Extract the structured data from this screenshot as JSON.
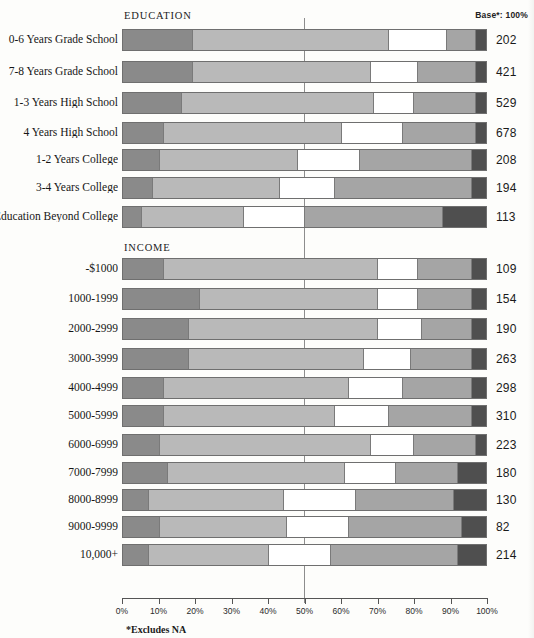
{
  "headers": {
    "education": "EDUCATION",
    "income": "INCOME",
    "base": "Base*: 100%"
  },
  "footnote": "*Excludes NA",
  "axis": {
    "ticks": [
      "0%",
      "10%",
      "20%",
      "30%",
      "40%",
      "50%",
      "60%",
      "70%",
      "80%",
      "90%",
      "100%"
    ],
    "values": [
      0,
      10,
      20,
      30,
      40,
      50,
      60,
      70,
      80,
      90,
      100
    ],
    "reference_line": 50
  },
  "colors": {
    "seg1": "#8a8a8a",
    "seg2": "#b9b9b9",
    "seg3": "#ffffff",
    "seg4": "#a5a5a5",
    "seg5": "#4f4f4f",
    "outline": "#6f6f6f",
    "rule": "#8d8d8d"
  },
  "chart_data": {
    "type": "bar",
    "title": "",
    "subtitle": "",
    "orientation": "horizontal",
    "stacked": true,
    "normalized": true,
    "xlabel": "",
    "ylabel": "",
    "xlim": [
      0,
      100
    ],
    "grid": false,
    "legend_position": "none",
    "reference_line": 50,
    "base_column_header": "Base*: 100%",
    "series": [
      {
        "name": "segment-1",
        "color": "#8a8a8a"
      },
      {
        "name": "segment-2",
        "color": "#b9b9b9"
      },
      {
        "name": "segment-3",
        "color": "#ffffff"
      },
      {
        "name": "segment-4",
        "color": "#a5a5a5"
      },
      {
        "name": "segment-5",
        "color": "#4f4f4f"
      }
    ],
    "groups": [
      {
        "name": "EDUCATION",
        "rows": [
          {
            "label": "0-6 Years Grade School",
            "base": "202",
            "values": [
              19,
              54,
              16,
              8,
              3
            ]
          },
          {
            "label": "7-8 Years Grade School",
            "base": "421",
            "values": [
              19,
              49,
              13,
              16,
              3
            ]
          },
          {
            "label": "1-3 Years High School",
            "base": "529",
            "values": [
              16,
              53,
              11,
              17,
              3
            ]
          },
          {
            "label": "4 Years High School",
            "base": "678",
            "values": [
              11,
              49,
              17,
              20,
              3
            ]
          },
          {
            "label": "1-2 Years College",
            "base": "208",
            "values": [
              10,
              38,
              17,
              31,
              4
            ]
          },
          {
            "label": "3-4 Years College",
            "base": "194",
            "values": [
              8,
              35,
              15,
              38,
              4
            ]
          },
          {
            "label": "Education Beyond College",
            "base": "113",
            "values": [
              5,
              28,
              17,
              38,
              12
            ]
          }
        ]
      },
      {
        "name": "INCOME",
        "rows": [
          {
            "label": "-$1000",
            "base": "109",
            "values": [
              11,
              59,
              11,
              15,
              4
            ]
          },
          {
            "label": "1000-1999",
            "base": "154",
            "values": [
              21,
              49,
              11,
              15,
              4
            ]
          },
          {
            "label": "2000-2999",
            "base": "190",
            "values": [
              18,
              52,
              12,
              14,
              4
            ]
          },
          {
            "label": "3000-3999",
            "base": "263",
            "values": [
              18,
              48,
              13,
              17,
              4
            ]
          },
          {
            "label": "4000-4999",
            "base": "298",
            "values": [
              11,
              51,
              15,
              19,
              4
            ]
          },
          {
            "label": "5000-5999",
            "base": "310",
            "values": [
              11,
              47,
              15,
              23,
              4
            ]
          },
          {
            "label": "6000-6999",
            "base": "223",
            "values": [
              10,
              58,
              12,
              17,
              3
            ]
          },
          {
            "label": "7000-7999",
            "base": "180",
            "values": [
              12,
              49,
              14,
              17,
              8
            ]
          },
          {
            "label": "8000-8999",
            "base": "130",
            "values": [
              7,
              37,
              20,
              27,
              9
            ]
          },
          {
            "label": "9000-9999",
            "base": "82",
            "values": [
              10,
              35,
              17,
              31,
              7
            ]
          },
          {
            "label": "10,000+",
            "base": "214",
            "values": [
              7,
              33,
              17,
              35,
              8
            ]
          }
        ]
      }
    ]
  }
}
